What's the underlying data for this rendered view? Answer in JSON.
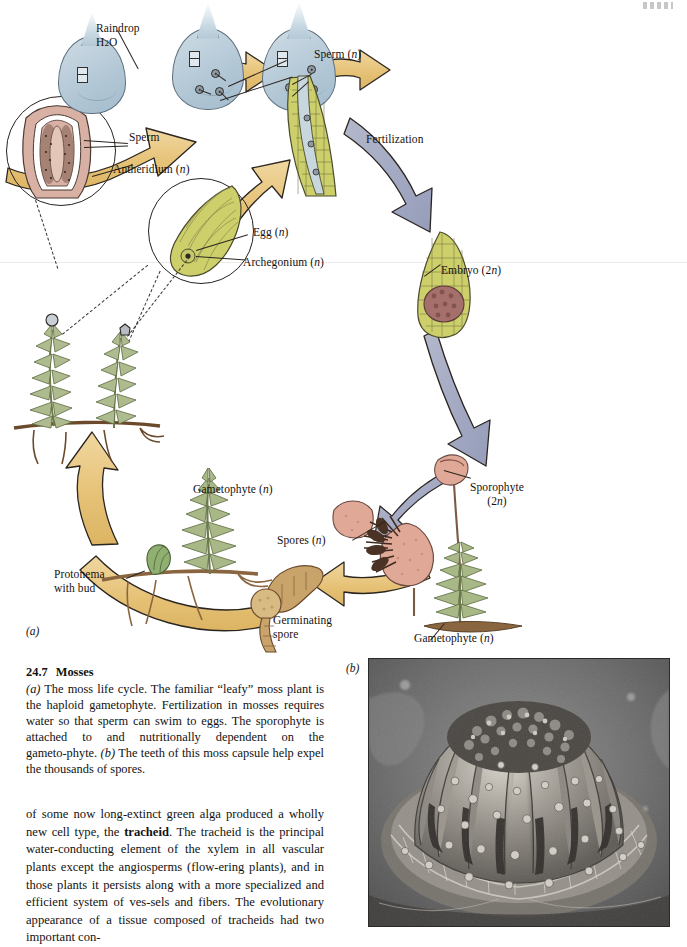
{
  "page": {
    "figure_number": "24.7",
    "figure_title": "Mosses",
    "panel_a_tag": "(a)",
    "panel_b_tag": "(b)"
  },
  "caption": {
    "number": "24.7",
    "title": "Mosses",
    "text": "(a) The moss life cycle. The familiar \"leafy\" moss plant is the haploid gametophyte. Fertilization in mosses requires water so that sperm can swim to eggs. The sporophyte is attached to and nutritionally dependent on the gametophyte. (b) The teeth of this moss capsule help expel the thousands of spores."
  },
  "body_text": {
    "paragraph": "of some now long-extinct green alga produced a wholly new cell type, the tracheid. The tracheid is the principal water-conducting element of the xylem in all vascular plants except the angiosperms (flowering plants), and in those plants it persists along with a more specialized and efficient system of vessels and fibers. The evolutionary appearance of a tissue composed of tracheids had two important con-",
    "bold_term": "tracheid"
  },
  "diagram": {
    "name": "moss-life-cycle",
    "labels": [
      {
        "id": "raindrop",
        "text": "Raindrop\nH₂O"
      },
      {
        "id": "sperm",
        "text": "Sperm"
      },
      {
        "id": "antheridium",
        "text": "Antheridium (n)"
      },
      {
        "id": "sperm-n",
        "text": "Sperm (n)"
      },
      {
        "id": "fertilization",
        "text": "Fertilization"
      },
      {
        "id": "egg",
        "text": "Egg (n)"
      },
      {
        "id": "archegonium",
        "text": "Archegonium (n)"
      },
      {
        "id": "embryo",
        "text": "Embryo (2n)"
      },
      {
        "id": "sporophyte",
        "text": "Sporophyte\n(2n)"
      },
      {
        "id": "gametophyte-right",
        "text": "Gametophyte (n)"
      },
      {
        "id": "gametophyte-left",
        "text": "Gametophyte (n)"
      },
      {
        "id": "spores",
        "text": "Spores (n)"
      },
      {
        "id": "germinating",
        "text": "Germinating\nspore"
      },
      {
        "id": "protonema",
        "text": "Protonema\nwith bud"
      }
    ],
    "colors": {
      "raindrop": "#b4c8d6",
      "gold_arrow": "#e8c883",
      "gray_arrow": "#a3a9c2",
      "gametophyte_green": "#9cab7e",
      "archegonium_green": "#cdd06a",
      "sporophyte_pink": "#dfa897",
      "spore_tan": "#c8a36a",
      "antheridium_pink": "#d8b0a4",
      "outline": "#2b2520"
    }
  },
  "photo": {
    "alt_name": "moss-capsule-sem-micrograph",
    "description": "Scanning electron micrograph of a moss capsule showing peristome teeth"
  }
}
